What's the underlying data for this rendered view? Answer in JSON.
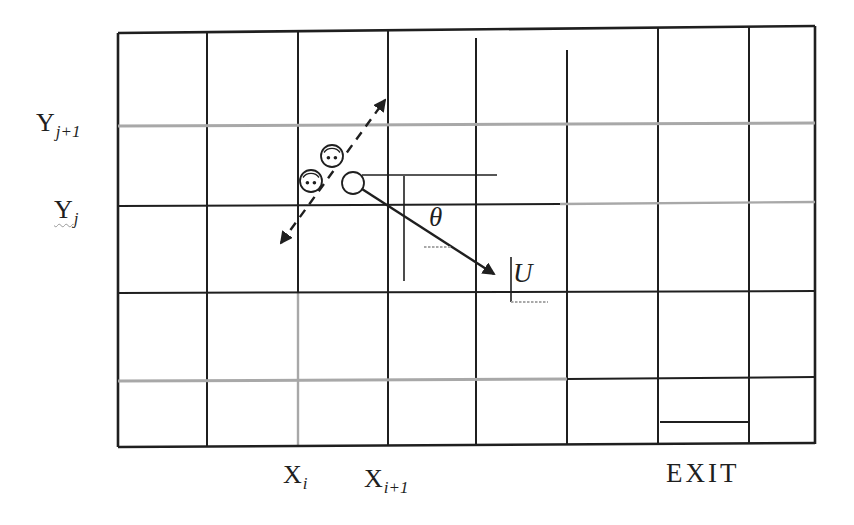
{
  "figure": {
    "kind": "grid-diagram",
    "grid": {
      "rows": 5,
      "columns": 8
    }
  },
  "labels": {
    "y_upper": {
      "base": "Y",
      "sub": "j+1"
    },
    "y_lower": {
      "base": "Y",
      "sub": "j"
    },
    "x_left": {
      "base": "X",
      "sub": "i"
    },
    "x_right": {
      "base": "X",
      "sub": "i+1"
    },
    "exit": "EXIT",
    "theta": "θ",
    "velocity": "U"
  },
  "colors": {
    "ink": "#1f1f1f",
    "faded": "#a8a8a8",
    "background": "#ffffff"
  }
}
